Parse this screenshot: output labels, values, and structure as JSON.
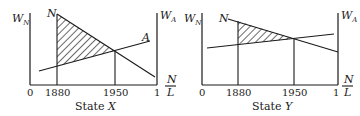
{
  "panels": [
    {
      "caption_prefix": "State ",
      "caption_var": "X",
      "left_axis_label": "W",
      "left_axis_sub": "N",
      "right_axis_label": "W",
      "right_axis_sub": "A",
      "curve_n_label": "N",
      "curve_a_label": "A",
      "x_ticks": [
        "0",
        "1880",
        "1950",
        "1"
      ],
      "x_axis_label_num": "N",
      "x_axis_label_den": "L"
    },
    {
      "caption_prefix": "State ",
      "caption_var": "Y",
      "left_axis_label": "W",
      "left_axis_sub": "N",
      "right_axis_label": "W",
      "right_axis_sub": "A",
      "curve_n_label": "N",
      "x_ticks": [
        "0",
        "1880",
        "1950",
        "1"
      ],
      "x_axis_label_num": "N",
      "x_axis_label_den": "L"
    }
  ]
}
